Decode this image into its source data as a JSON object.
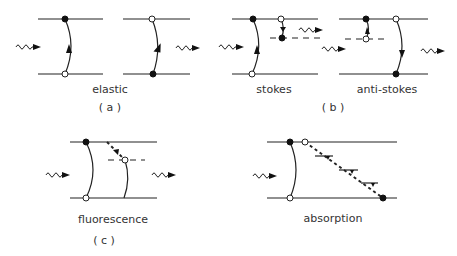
{
  "figure": {
    "panels": {
      "a": {
        "tag": "( a )",
        "diagrams": [
          {
            "label": "elastic"
          }
        ]
      },
      "b": {
        "tag": "( b )",
        "diagrams": [
          {
            "label": "stokes"
          },
          {
            "label": "anti-stokes"
          }
        ]
      },
      "c": {
        "tag": "( c )",
        "diagrams": [
          {
            "label": "fluorescence"
          }
        ]
      },
      "d": {
        "diagrams": [
          {
            "label": "absorption"
          }
        ]
      }
    },
    "legend_semantics": {
      "filled_dot": "occupied-state",
      "open_dot": "vacant-state",
      "wavy_arrow": "photon",
      "dashed_line": "intermediate-level"
    }
  }
}
